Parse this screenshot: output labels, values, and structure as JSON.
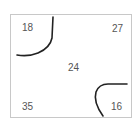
{
  "diagram": {
    "type": "square-with-corner-arcs",
    "border_color": "#c8c8c8",
    "curve_color": "#222222",
    "text_color": "#555555",
    "labels": {
      "top_left": "18",
      "top_right": "27",
      "center": "24",
      "bottom_left": "35",
      "bottom_right": "16"
    },
    "curves": [
      {
        "name": "top-left-arc",
        "near": "top_right of top-left quadrant"
      },
      {
        "name": "bottom-right-arc",
        "near": "bottom-right corner"
      }
    ]
  }
}
